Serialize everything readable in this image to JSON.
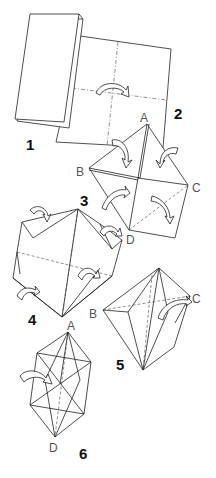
{
  "diagram": {
    "type": "origami-instructions",
    "steps": [
      {
        "number": "1",
        "description": "folded paper rectangle"
      },
      {
        "number": "2",
        "description": "unfolded square with crease lines and rotate arrow"
      },
      {
        "number": "3",
        "description": "square folded with corners A, B, C, D and fold arrows"
      },
      {
        "number": "4",
        "description": "folded form with flap arrows"
      },
      {
        "number": "5",
        "description": "kite shape between points B and C"
      },
      {
        "number": "6",
        "description": "elongated diamond between A and D"
      }
    ],
    "labels": {
      "step1": "1",
      "step2": "2",
      "step3": "3",
      "step4": "4",
      "step5": "5",
      "step6": "6",
      "a_top": "A",
      "b_left": "B",
      "c_right": "C",
      "d_bottom3": "D",
      "a_step6": "A",
      "b_step5": "B",
      "c_step5": "C",
      "d_step6": "D"
    },
    "colors": {
      "line": "#222222",
      "background": "#ffffff"
    }
  }
}
